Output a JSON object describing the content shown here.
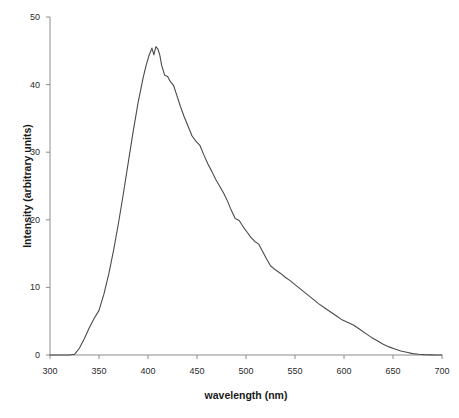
{
  "chart_data": {
    "type": "line",
    "title": "",
    "subtitle": "",
    "xlabel": "wavelength (nm)",
    "ylabel": "Intensity (arbitrary units)",
    "xlim": [
      300,
      700
    ],
    "ylim": [
      0,
      50
    ],
    "xticks": [
      300,
      350,
      400,
      450,
      500,
      550,
      600,
      650,
      700
    ],
    "yticks": [
      0,
      10,
      20,
      30,
      40,
      50
    ],
    "xtick_labels": [
      "300",
      "350",
      "400",
      "450",
      "500",
      "550",
      "600",
      "650",
      "700"
    ],
    "ytick_labels": [
      "0",
      "10",
      "20",
      "30",
      "40",
      "50"
    ],
    "grid": false,
    "legend": null,
    "series": [
      {
        "name": "emission spectrum",
        "color": "#4a4a4a",
        "line_width": 1.1,
        "x": [
          300,
          310,
          320,
          325,
          330,
          335,
          340,
          345,
          350,
          355,
          360,
          365,
          370,
          375,
          380,
          385,
          390,
          395,
          398,
          401,
          404,
          406,
          408,
          410,
          412,
          414,
          417,
          420,
          423,
          426,
          429,
          433,
          437,
          441,
          445,
          449,
          453,
          457,
          461,
          465,
          469,
          473,
          477,
          481,
          485,
          489,
          493,
          497,
          501,
          505,
          509,
          513,
          517,
          521,
          525,
          530,
          535,
          540,
          545,
          550,
          556,
          562,
          568,
          574,
          580,
          586,
          592,
          598,
          604,
          610,
          616,
          622,
          628,
          634,
          640,
          646,
          652,
          658,
          664,
          670,
          676,
          682,
          688,
          694,
          700
        ],
        "y": [
          0,
          0,
          0,
          0.1,
          1.0,
          2.4,
          4.0,
          5.4,
          6.6,
          9.0,
          12.0,
          15.6,
          19.6,
          24.0,
          28.6,
          33.2,
          37.4,
          41.0,
          42.8,
          44.3,
          45.4,
          44.4,
          45.6,
          45.3,
          44.4,
          42.8,
          41.4,
          41.2,
          40.4,
          39.9,
          38.6,
          36.8,
          35.2,
          33.8,
          32.4,
          31.6,
          31.0,
          29.6,
          28.3,
          27.2,
          26.0,
          25.0,
          24.0,
          22.8,
          21.4,
          20.2,
          19.9,
          19.0,
          18.2,
          17.4,
          16.8,
          16.4,
          15.3,
          14.2,
          13.2,
          12.6,
          12.1,
          11.5,
          11.0,
          10.4,
          9.7,
          9.0,
          8.3,
          7.6,
          7.0,
          6.4,
          5.8,
          5.2,
          4.8,
          4.4,
          3.8,
          3.2,
          2.6,
          2.1,
          1.6,
          1.2,
          0.9,
          0.6,
          0.4,
          0.2,
          0.1,
          0.05,
          0.02,
          0.0,
          0.0
        ],
        "annotations": [
          {
            "label": "onset",
            "x": 325,
            "y": 0
          },
          {
            "label": "peak-1",
            "x": 404,
            "y": 45.4
          },
          {
            "label": "peak-2",
            "x": 408,
            "y": 45.6
          },
          {
            "label": "shoulder-1",
            "x": 426,
            "y": 39.9
          },
          {
            "label": "shoulder-2",
            "x": 453,
            "y": 31.0
          },
          {
            "label": "shoulder-3",
            "x": 489,
            "y": 20.2
          },
          {
            "label": "shoulder-4",
            "x": 517,
            "y": 15.3
          },
          {
            "label": "baseline-return",
            "x": 676,
            "y": 0.1
          }
        ]
      }
    ],
    "axis_color": "#8c8c8c",
    "plot_background": "#ffffff"
  },
  "axes": {
    "y_title": "Intensity (arbitrary units)",
    "x_title": "wavelength (nm)"
  }
}
